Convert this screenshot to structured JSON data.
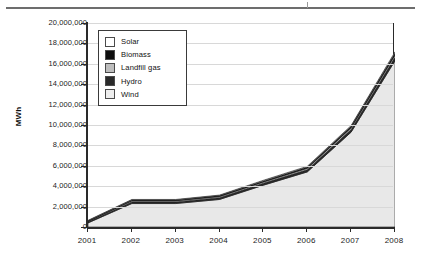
{
  "chart_data": {
    "type": "area",
    "stacked": true,
    "title": "",
    "subtitle": "",
    "xlabel": "",
    "ylabel": "MWh",
    "categories": [
      "2001",
      "2002",
      "2003",
      "2004",
      "2005",
      "2006",
      "2007",
      "2008"
    ],
    "x": [
      2001,
      2002,
      2003,
      2004,
      2005,
      2006,
      2007,
      2008
    ],
    "ylim": [
      0,
      20000000
    ],
    "ytick_step": 2000000,
    "ytick_labels": [
      "20,000,000",
      "18,000,000",
      "16,000,000",
      "14,000,000",
      "12,000,000",
      "10,000,000",
      "8,000,000",
      "6,000,000",
      "4,000,000",
      "2,000,000",
      "0"
    ],
    "ytick_values": [
      20000000,
      18000000,
      16000000,
      14000000,
      12000000,
      10000000,
      8000000,
      6000000,
      4000000,
      2000000,
      0
    ],
    "grid": true,
    "grid_axis": "y",
    "legend_position": "top-left-inside",
    "series": [
      {
        "name": "Wind",
        "color": "#e8e8e8",
        "values": [
          400000,
          2300000,
          2300000,
          2700000,
          4100000,
          5400000,
          9300000,
          16300000
        ]
      },
      {
        "name": "Hydro",
        "color": "#2a2a2a",
        "values": [
          90000,
          160000,
          160000,
          170000,
          190000,
          210000,
          250000,
          330000
        ]
      },
      {
        "name": "Landfill gas",
        "color": "#bdbdbd",
        "values": [
          60000,
          110000,
          110000,
          120000,
          130000,
          150000,
          180000,
          230000
        ]
      },
      {
        "name": "Biomass",
        "color": "#0d0d0d",
        "values": [
          60000,
          80000,
          80000,
          90000,
          100000,
          120000,
          140000,
          200000
        ]
      },
      {
        "name": "Solar",
        "color": "#ffffff",
        "values": [
          40000,
          50000,
          50000,
          50000,
          60000,
          70000,
          80000,
          110000
        ]
      }
    ],
    "totals": [
      650000,
      2700000,
      2700000,
      3130000,
      4580000,
      5950000,
      9950000,
      17170000
    ]
  },
  "legend": {
    "items": [
      {
        "label": "Solar",
        "swatch": "#ffffff"
      },
      {
        "label": "Biomass",
        "swatch": "#0d0d0d"
      },
      {
        "label": "Landfill gas",
        "swatch": "#bdbdbd"
      },
      {
        "label": "Hydro",
        "swatch": "#2a2a2a"
      },
      {
        "label": "Wind",
        "swatch": "#ededed"
      }
    ]
  },
  "axes": {
    "y_title": "MWh"
  }
}
